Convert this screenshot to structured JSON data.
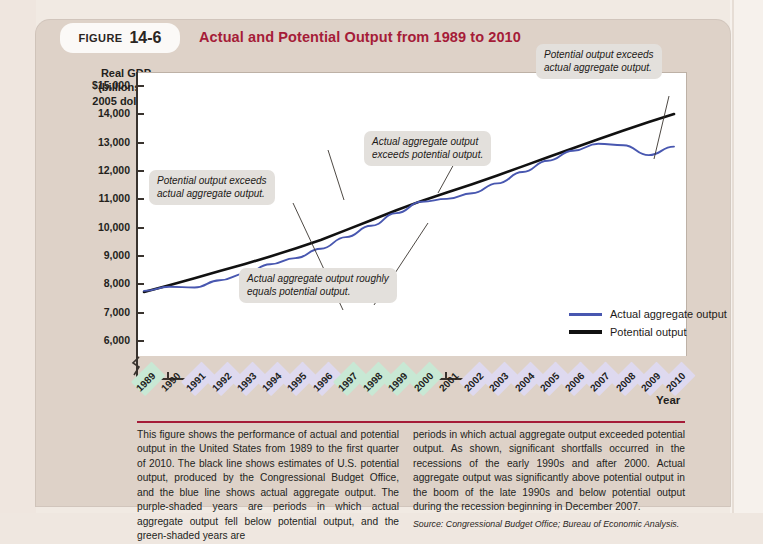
{
  "figure": {
    "label_word": "FIGURE",
    "number": "14-6",
    "title": "Actual and Potential Output from 1989 to 2010",
    "title_color": "#a51c38"
  },
  "chart_data": {
    "type": "line",
    "title": "Actual and Potential Output from 1989 to 2010",
    "xlabel": "Year",
    "ylabel": "Real GDP\n(billions of\n2005 dollars)",
    "ylabel_lines": [
      "Real GDP",
      "(billions of",
      "2005 dollars)"
    ],
    "ylim": [
      5500,
      15500
    ],
    "yticks": [
      6000,
      7000,
      8000,
      9000,
      10000,
      11000,
      12000,
      13000,
      14000,
      15000
    ],
    "ytick_labels": [
      "6,000",
      "7,000",
      "8,000",
      "9,000",
      "10,000",
      "11,000",
      "12,000",
      "13,000",
      "14,000",
      "$15,000"
    ],
    "axis_break": true,
    "grid": false,
    "legend_position": "inside-lower-right",
    "x": [
      1989,
      1990,
      1991,
      1992,
      1993,
      1994,
      1995,
      1996,
      1997,
      1998,
      1999,
      2000,
      2001,
      2002,
      2003,
      2004,
      2005,
      2006,
      2007,
      2008,
      2009,
      2010
    ],
    "xtick_labels": [
      "1989",
      "1990",
      "1991",
      "1992",
      "1993",
      "1994",
      "1995",
      "1996",
      "1997",
      "1998",
      "1999",
      "2000",
      "2001",
      "2002",
      "2003",
      "2004",
      "2005",
      "2006",
      "2007",
      "2008",
      "2009",
      "2010"
    ],
    "series": [
      {
        "name": "Actual aggregate output",
        "color": "#4857b0",
        "values": [
          7800,
          7950,
          7920,
          8180,
          8400,
          8740,
          8960,
          9290,
          9700,
          10100,
          10550,
          10950,
          11050,
          11250,
          11600,
          12000,
          12400,
          12750,
          13000,
          12950,
          12600,
          12900
        ]
      },
      {
        "name": "Potential output",
        "color": "#111111",
        "values": [
          7760,
          8000,
          8250,
          8500,
          8750,
          9020,
          9300,
          9600,
          9950,
          10300,
          10650,
          10980,
          11280,
          11570,
          11880,
          12200,
          12520,
          12840,
          13160,
          13470,
          13770,
          14050
        ]
      }
    ],
    "band_green_label": "green-shaded",
    "band_purple_label": "purple-shaded",
    "band_green_color": "#c8e8d4",
    "band_purple_color": "#ded9ef",
    "year_bands": [
      {
        "year": "1989",
        "shade": "green"
      },
      {
        "year": "1990",
        "shade": "none"
      },
      {
        "year": "1991",
        "shade": "purple"
      },
      {
        "year": "1992",
        "shade": "purple"
      },
      {
        "year": "1993",
        "shade": "purple"
      },
      {
        "year": "1994",
        "shade": "purple"
      },
      {
        "year": "1995",
        "shade": "purple"
      },
      {
        "year": "1996",
        "shade": "purple"
      },
      {
        "year": "1997",
        "shade": "green"
      },
      {
        "year": "1998",
        "shade": "green"
      },
      {
        "year": "1999",
        "shade": "green"
      },
      {
        "year": "2000",
        "shade": "green"
      },
      {
        "year": "2001",
        "shade": "none"
      },
      {
        "year": "2002",
        "shade": "purple"
      },
      {
        "year": "2003",
        "shade": "purple"
      },
      {
        "year": "2004",
        "shade": "purple"
      },
      {
        "year": "2005",
        "shade": "purple"
      },
      {
        "year": "2006",
        "shade": "purple"
      },
      {
        "year": "2007",
        "shade": "purple"
      },
      {
        "year": "2008",
        "shade": "purple"
      },
      {
        "year": "2009",
        "shade": "purple"
      },
      {
        "year": "2010",
        "shade": "purple"
      }
    ],
    "annotations": [
      {
        "id": "a1",
        "line1": "Potential output exceeds",
        "line2": "actual aggregate output."
      },
      {
        "id": "a2",
        "line1": "Actual aggregate output roughly",
        "line2": "equals potential output."
      },
      {
        "id": "a3",
        "line1": "Actual aggregate output",
        "line2": "exceeds potential output."
      },
      {
        "id": "a4",
        "line1": "Potential output exceeds",
        "line2": "actual aggregate output."
      }
    ],
    "legend": [
      {
        "label": "Actual aggregate output",
        "color": "#4857b0"
      },
      {
        "label": "Potential output",
        "color": "#111111"
      }
    ]
  },
  "caption": {
    "left": "This figure shows the performance of actual and potential output in the United States from 1989 to the first quarter of 2010. The black line shows estimates of U.S. potential output, produced by the Congressional Budget Office, and the blue line shows actual aggregate output. The purple-shaded years are periods in which actual aggregate output fell below potential output, and the green-shaded years are",
    "right": "periods in which actual aggregate output exceeded potential output. As shown, significant shortfalls occurred in the recessions of the early 1990s and after 2000. Actual aggregate output was significantly above potential output in the boom of the late 1990s and below potential output during the recession beginning in December 2007.",
    "source_label": "Source:",
    "source_text": " Congressional Budget Office; Bureau of Economic Analysis."
  }
}
